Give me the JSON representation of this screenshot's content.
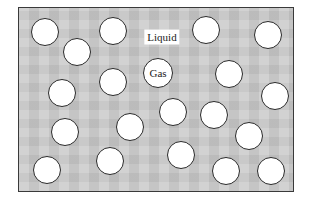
{
  "diagram": {
    "type": "particle-model",
    "frame": {
      "left": 18,
      "top": 7,
      "right": 294,
      "bottom": 192,
      "fill": "#c9c9c9",
      "border": "#3a3a3a"
    },
    "labels": {
      "liquid": "Liquid",
      "gas": "Gas"
    },
    "liquid_label_pos": {
      "x": 162,
      "y": 37
    },
    "gas_particle": {
      "x": 158,
      "y": 73
    },
    "particles": [
      {
        "x": 45,
        "y": 32
      },
      {
        "x": 77,
        "y": 52
      },
      {
        "x": 113,
        "y": 31
      },
      {
        "x": 206,
        "y": 30
      },
      {
        "x": 268,
        "y": 35
      },
      {
        "x": 62,
        "y": 93
      },
      {
        "x": 113,
        "y": 82
      },
      {
        "x": 229,
        "y": 74
      },
      {
        "x": 275,
        "y": 96
      },
      {
        "x": 65,
        "y": 132
      },
      {
        "x": 130,
        "y": 127
      },
      {
        "x": 173,
        "y": 112
      },
      {
        "x": 214,
        "y": 115
      },
      {
        "x": 249,
        "y": 136
      },
      {
        "x": 47,
        "y": 170
      },
      {
        "x": 110,
        "y": 161
      },
      {
        "x": 181,
        "y": 155
      },
      {
        "x": 226,
        "y": 171
      },
      {
        "x": 271,
        "y": 171
      }
    ],
    "particle_count": 19,
    "colors": {
      "particle_fill": "#ffffff",
      "particle_stroke": "#2a2a2a",
      "background": "#c9c9c9"
    }
  }
}
